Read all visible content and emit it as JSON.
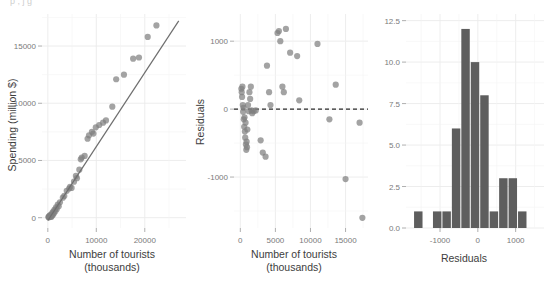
{
  "figure": {
    "ghost_text": "p , j       g",
    "panels": [
      "scatter",
      "residual",
      "histogram"
    ]
  },
  "chart_data": [
    {
      "type": "scatter",
      "id": "scatter",
      "title": "",
      "xlabel": "Number of tourists",
      "xlabel_line2": "(thousands)",
      "ylabel": "Spending (million $)",
      "xlim": [
        -1200,
        28500
      ],
      "ylim": [
        -900,
        17800
      ],
      "xticks": [
        0,
        10000,
        20000
      ],
      "xtick_labels": [
        "0",
        "10000",
        "20000"
      ],
      "yticks": [
        0,
        5000,
        10000,
        15000
      ],
      "ytick_labels": [
        "0",
        "5000",
        "10000",
        "15000"
      ],
      "grid": true,
      "point_color": "#7f7f7f",
      "line_color": "#6e6e6e",
      "fit_line": {
        "x0": 0,
        "y0": -260,
        "x1": 27000,
        "y1": 17200
      },
      "points": [
        [
          120,
          60
        ],
        [
          200,
          30
        ],
        [
          260,
          110
        ],
        [
          330,
          55
        ],
        [
          400,
          180
        ],
        [
          470,
          95
        ],
        [
          540,
          230
        ],
        [
          610,
          140
        ],
        [
          700,
          60
        ],
        [
          760,
          300
        ],
        [
          850,
          180
        ],
        [
          930,
          420
        ],
        [
          1050,
          260
        ],
        [
          1150,
          560
        ],
        [
          1260,
          380
        ],
        [
          1400,
          700
        ],
        [
          1550,
          560
        ],
        [
          1700,
          900
        ],
        [
          1850,
          760
        ],
        [
          2050,
          1150
        ],
        [
          2250,
          1000
        ],
        [
          2500,
          1350
        ],
        [
          3100,
          1750
        ],
        [
          3400,
          1900
        ],
        [
          3900,
          2350
        ],
        [
          4400,
          2550
        ],
        [
          4600,
          2700
        ],
        [
          4900,
          2600
        ],
        [
          5400,
          3150
        ],
        [
          5800,
          3650
        ],
        [
          6000,
          3450
        ],
        [
          6500,
          4200
        ],
        [
          6800,
          5100
        ],
        [
          7000,
          5250
        ],
        [
          7600,
          5400
        ],
        [
          8200,
          6900
        ],
        [
          8500,
          7200
        ],
        [
          9100,
          7500
        ],
        [
          9400,
          7350
        ],
        [
          9900,
          7900
        ],
        [
          10600,
          8100
        ],
        [
          11400,
          8300
        ],
        [
          12000,
          8500
        ],
        [
          13300,
          9700
        ],
        [
          14100,
          12100
        ],
        [
          15700,
          12500
        ],
        [
          17600,
          13900
        ],
        [
          18800,
          14000
        ],
        [
          20600,
          15800
        ],
        [
          22400,
          16800
        ]
      ]
    },
    {
      "type": "scatter",
      "id": "residual",
      "title": "",
      "xlabel": "Number of tourists",
      "xlabel_line2": "(thousands)",
      "ylabel": "Residuals",
      "xlim": [
        -900,
        18200
      ],
      "ylim": [
        -1750,
        1400
      ],
      "xticks": [
        0,
        5000,
        10000,
        15000
      ],
      "xtick_labels": [
        "0",
        "5000",
        "10000",
        "15000"
      ],
      "yticks": [
        -1000,
        0,
        1000
      ],
      "ytick_labels": [
        "-1000",
        "0",
        "1000"
      ],
      "grid": true,
      "zero_line": 0,
      "zero_line_style": "dashed",
      "point_color": "#7f7f7f",
      "points": [
        [
          150,
          300
        ],
        [
          200,
          250
        ],
        [
          250,
          180
        ],
        [
          300,
          330
        ],
        [
          350,
          60
        ],
        [
          400,
          -40
        ],
        [
          450,
          20
        ],
        [
          500,
          -150
        ],
        [
          550,
          -260
        ],
        [
          600,
          -120
        ],
        [
          650,
          -330
        ],
        [
          700,
          -420
        ],
        [
          750,
          -200
        ],
        [
          800,
          -520
        ],
        [
          850,
          -600
        ],
        [
          900,
          -480
        ],
        [
          950,
          -560
        ],
        [
          1000,
          -300
        ],
        [
          1100,
          60
        ],
        [
          1200,
          -30
        ],
        [
          1300,
          250
        ],
        [
          1400,
          150
        ],
        [
          1500,
          330
        ],
        [
          1600,
          -20
        ],
        [
          1700,
          -60
        ],
        [
          1900,
          -30
        ],
        [
          2200,
          -20
        ],
        [
          2900,
          -460
        ],
        [
          3200,
          -640
        ],
        [
          3600,
          -700
        ],
        [
          3800,
          640
        ],
        [
          4100,
          250
        ],
        [
          4300,
          60
        ],
        [
          5300,
          1120
        ],
        [
          5500,
          1150
        ],
        [
          5700,
          1000
        ],
        [
          6000,
          330
        ],
        [
          6200,
          250
        ],
        [
          6500,
          1180
        ],
        [
          7100,
          830
        ],
        [
          8100,
          780
        ],
        [
          8400,
          130
        ],
        [
          11000,
          960
        ],
        [
          12700,
          -150
        ],
        [
          13600,
          360
        ],
        [
          15000,
          -1030
        ],
        [
          17000,
          -200
        ],
        [
          17400,
          -1600
        ]
      ]
    },
    {
      "type": "bar",
      "id": "histogram",
      "title": "",
      "xlabel": "Residuals",
      "ylabel": "",
      "xlim": [
        -1900,
        1750
      ],
      "ylim": [
        0,
        12.9
      ],
      "xticks": [
        -1000,
        0,
        1000
      ],
      "xtick_labels": [
        "-1000",
        "0",
        "1000"
      ],
      "yticks": [
        0.0,
        2.5,
        5.0,
        7.5,
        10.0,
        12.5
      ],
      "ytick_labels": [
        "0.0",
        "2.5",
        "5.0",
        "7.5",
        "10.0",
        "12.5"
      ],
      "grid": true,
      "bar_color": "#5e5e5e",
      "bin_width": 250,
      "bin_starts": [
        -1700,
        -1200,
        -950,
        -700,
        -450,
        -200,
        50,
        300,
        550,
        800,
        1050
      ],
      "categories": [
        "-1700",
        "-1200",
        "-950",
        "-700",
        "-450",
        "-200",
        "50",
        "300",
        "550",
        "800",
        "1050"
      ],
      "values": [
        1,
        1,
        1,
        6,
        12,
        10,
        8,
        1,
        3,
        3,
        1
      ]
    }
  ]
}
